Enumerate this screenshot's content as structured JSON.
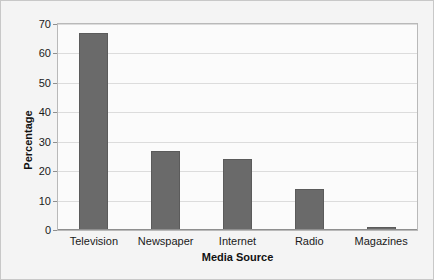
{
  "chart_data": {
    "type": "bar",
    "title": "",
    "xlabel": "Media Source",
    "ylabel": "Percentage",
    "categories": [
      "Television",
      "Newspaper",
      "Internet",
      "Radio",
      "Magazines"
    ],
    "values": [
      67,
      27,
      24,
      14,
      1
    ],
    "ylim": [
      0,
      70
    ],
    "ytick_labels": [
      "0",
      "10",
      "20",
      "30",
      "40",
      "50",
      "60",
      "70"
    ],
    "ytick_values": [
      0,
      10,
      20,
      30,
      40,
      50,
      60,
      70
    ],
    "grid": "horizontal",
    "legend": "none",
    "series": [
      {
        "name": "Percentage",
        "values": [
          67,
          27,
          24,
          14,
          1
        ],
        "color": "#6a6a6a"
      }
    ],
    "colors": {
      "bar_fill": "#6a6a6a",
      "bar_outline": "#5b5b5b",
      "gridline": "#dcdcdc",
      "plot_background": "#fbfbfb",
      "plot_border": "#b9b9b9",
      "figure_background": "#f4f4f4",
      "text": "#1a1a1a"
    }
  }
}
